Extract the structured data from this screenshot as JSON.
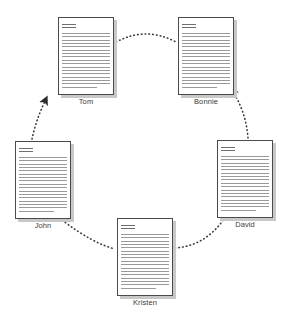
{
  "diagram": {
    "type": "document-cycle-diagram",
    "background_color": "#ffffff",
    "edge_color": "#3a3a3a",
    "doc_border_color": "#4a4a4a",
    "doc_fill_color": "#ffffff",
    "doc_shadow_color": "#c8c8c8",
    "label_color": "#3a3a3a",
    "nodes": [
      {
        "id": "tom",
        "label": "Tom",
        "icon": "document-icon",
        "x": 58,
        "y": 17,
        "width": 56,
        "height": 78,
        "label_y": 97,
        "header_lines": 2,
        "body_lines": 17
      },
      {
        "id": "bonnie",
        "label": "Bonnie",
        "icon": "document-icon",
        "x": 178,
        "y": 17,
        "width": 56,
        "height": 78,
        "label_y": 97,
        "header_lines": 2,
        "body_lines": 17
      },
      {
        "id": "david",
        "label": "David",
        "icon": "document-icon",
        "x": 217,
        "y": 140,
        "width": 56,
        "height": 78,
        "label_y": 220,
        "header_lines": 2,
        "body_lines": 17
      },
      {
        "id": "kristen",
        "label": "Kristen",
        "icon": "document-icon",
        "x": 117,
        "y": 218,
        "width": 56,
        "height": 78,
        "label_y": 298,
        "header_lines": 2,
        "body_lines": 17
      },
      {
        "id": "john",
        "label": "John",
        "icon": "document-icon",
        "x": 15,
        "y": 141,
        "width": 56,
        "height": 78,
        "label_y": 221,
        "header_lines": 2,
        "body_lines": 17
      }
    ],
    "edges": [
      {
        "id": "tom-bonnie",
        "from": "tom",
        "to": "bonnie",
        "style": "dotted",
        "arrowhead": false,
        "path": "M 116 42 Q 146 26 176 42"
      },
      {
        "id": "david-bonnie",
        "from": "david",
        "to": "bonnie",
        "style": "dotted",
        "arrowhead": true,
        "path": "M 248 138 Q 246 112 233 92"
      },
      {
        "id": "kristen-david",
        "from": "kristen",
        "to": "david",
        "style": "dotted",
        "arrowhead": false,
        "path": "M 175 248 Q 205 246 224 219"
      },
      {
        "id": "john-kristen",
        "from": "john",
        "to": "kristen",
        "style": "dotted",
        "arrowhead": false,
        "path": "M 62 220 Q 92 243 115 249"
      },
      {
        "id": "john-tom",
        "from": "john",
        "to": "tom",
        "style": "dotted",
        "arrowhead": true,
        "path": "M 32 139 Q 36 120 45 101"
      }
    ]
  }
}
